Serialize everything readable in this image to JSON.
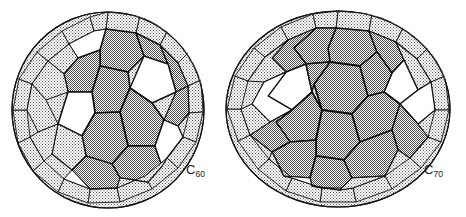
{
  "figure": {
    "background_color": "#ffffff",
    "line_color": "#111111",
    "shade_color": "#9d9d9d",
    "face_white_color": "#ffffff",
    "molecules": [
      {
        "id": "c60",
        "label_text": "C",
        "label_subscript": "60",
        "name": "buckminsterfullerene",
        "shape": "truncated icosahedron",
        "faces_hexagon": 20,
        "faces_pentagon": 12,
        "vertices": 60,
        "center_x": 108,
        "center_y": 110,
        "radius_x": 97,
        "radius_y": 99
      },
      {
        "id": "c70",
        "label_text": "C",
        "label_subscript": "70",
        "name": "fullerene-70",
        "shape": "elongated ellipsoidal cage",
        "faces_hexagon": 25,
        "faces_pentagon": 12,
        "vertices": 70,
        "center_x": 338,
        "center_y": 109,
        "radius_x": 113,
        "radius_y": 99
      }
    ]
  }
}
